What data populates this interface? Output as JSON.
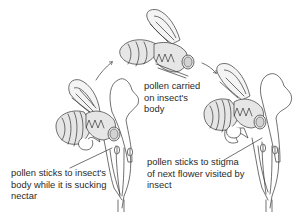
{
  "diagram": {
    "stages": [
      {
        "id": "first-flower",
        "label": "pollen sticks to insect's\nbody while it is sucking\nnectar"
      },
      {
        "id": "in-flight",
        "label": "pollen carried\non insect's\nbody"
      },
      {
        "id": "next-flower",
        "label": "pollen sticks to stigma\nof next flower visited by\ninsect"
      }
    ],
    "arrows": [
      {
        "from": "first-flower",
        "to": "in-flight"
      },
      {
        "from": "in-flight",
        "to": "next-flower"
      }
    ],
    "colors": {
      "line": "#333333",
      "body_fill": "#e6e6e6",
      "background": "#ffffff"
    }
  }
}
